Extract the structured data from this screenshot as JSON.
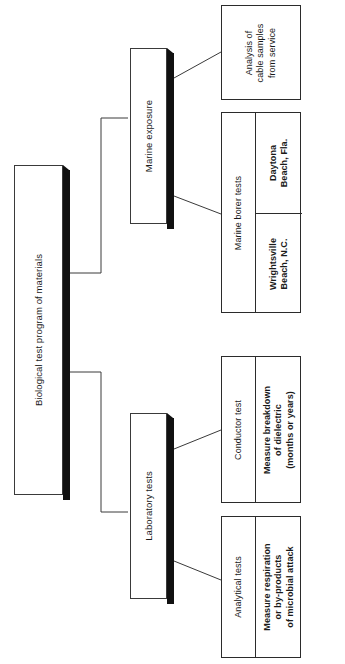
{
  "diagram": {
    "title": "Biological test program of materials",
    "orientation": "rotated-90",
    "root": {
      "label": "Biological test program of materials"
    },
    "branches": [
      {
        "label": "Marine exposure",
        "children": [
          {
            "label": "Analysis of\ncable samples\nfrom service",
            "sublabels": []
          },
          {
            "label": "Marine borer tests",
            "sublabels": [
              "Daytona\nBeach, Fla.",
              "Wrightsville\nBeach, N.C."
            ]
          }
        ]
      },
      {
        "label": "Laboratory tests",
        "children": [
          {
            "label": "Conductor test",
            "sublabels": [
              "Measure breakdown\nof dielectric\n(months or years)"
            ]
          },
          {
            "label": "Analytical tests",
            "sublabels": [
              "Measure respiration\nor by-products\nof microbial attack"
            ]
          }
        ]
      }
    ],
    "colors": {
      "stroke": "#3a3a3a",
      "shadow": "#111111",
      "background": "#ffffff",
      "text": "#1a1a1a"
    }
  }
}
